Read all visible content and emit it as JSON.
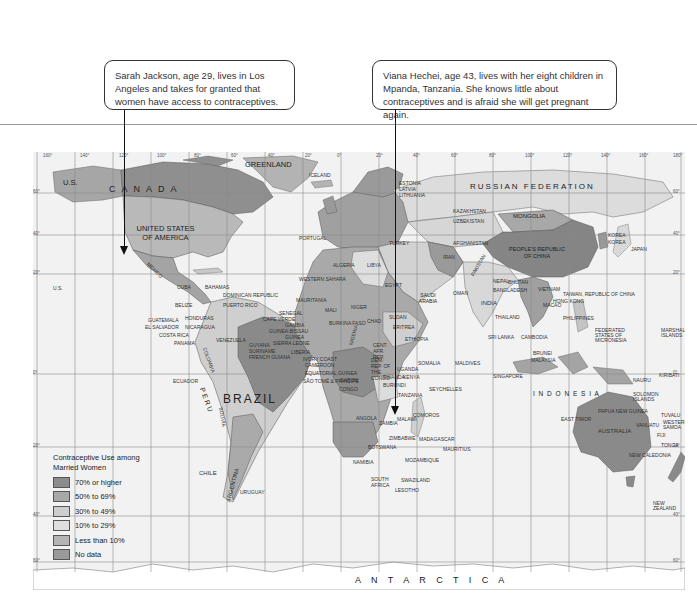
{
  "callouts": [
    {
      "id": "sarah",
      "text": "Sarah Jackson, age 29, lives in Los Angeles and takes for granted that women have access to contraceptives.",
      "points_to": "Los Angeles, United States"
    },
    {
      "id": "viana",
      "text": "Viana Hechei, age 43, lives with her eight children in Mpanda, Tanzania. She knows little about contraceptives and is afraid she will get pregnant again.",
      "points_to": "Mpanda, Tanzania"
    }
  ],
  "legend": {
    "title": "Contraceptive Use among Married Women",
    "items": [
      {
        "label": "70% or higher",
        "color": "#8c8c8c"
      },
      {
        "label": "50% to 69%",
        "color": "#a8a8a8"
      },
      {
        "label": "30% to 49%",
        "color": "#cdcdcd"
      },
      {
        "label": "10% to 29%",
        "color": "#dedede"
      },
      {
        "label": "Less than 10%",
        "color": "#b4b4b4"
      },
      {
        "label": "No data",
        "color": "#9a9a9a"
      }
    ]
  },
  "map": {
    "ocean_color": "#f2f2f2",
    "grid_color": "#8a8a8a",
    "longitude_ticks": [
      "160°",
      "140°",
      "120°",
      "100°",
      "80°",
      "60°",
      "40°",
      "20°",
      "0°",
      "20°",
      "40°",
      "60°",
      "80°",
      "100°",
      "120°",
      "140°",
      "160°",
      "180°"
    ],
    "latitude_ticks_left": [
      "60°",
      "40°",
      "20°",
      "0°",
      "20°",
      "40°",
      "60°"
    ],
    "latitude_ticks_right": [
      "60°",
      "40°",
      "20°",
      "0°",
      "20°",
      "40°",
      "60°"
    ],
    "labels": {
      "us_alaska": "U.S.",
      "canada": "C A N A D A",
      "greenland": "GREENLAND",
      "iceland": "ICELAND",
      "usa": "UNITED STATES OF AMERICA",
      "us_hawaii": "U.S.",
      "mexico": "MEXICO",
      "cuba": "CUBA",
      "bahamas": "BAHAMAS",
      "dominican_republic": "DOMINICAN REPUBLIC",
      "puerto_rico": "PUERTO RICO",
      "belize": "BELIZE",
      "honduras": "HONDURAS",
      "guatemala": "GUATEMALA",
      "el_salvador": "EL SALVADOR",
      "nicaragua": "NICARAGUA",
      "costa_rica": "COSTA RICA",
      "panama": "PANAMA",
      "venezuela": "VENEZUELA",
      "guyana": "GUYANA",
      "suriname": "SURINAME",
      "french_guiana": "FRENCH GUIANA",
      "colombia": "COLOMBIA",
      "ecuador": "ECUADOR",
      "peru": "PERU",
      "brazil": "BRAZIL",
      "bolivia": "BOLIVIA",
      "chile": "CHILE",
      "argentina": "ARGENTINA",
      "uruguay": "URUGUAY",
      "portugal": "PORTUGAL",
      "russia": "RUSSIAN FEDERATION",
      "estonia": "ESTONIA",
      "latvia": "LATVIA",
      "lithuania": "LITHUANIA",
      "kazakhstan": "KAZAKHSTAN",
      "uzbekistan": "UZBEKISTAN",
      "mongolia": "MONGOLIA",
      "china": "PEOPLE'S REPUBLIC OF CHINA",
      "korea_n": "KOREA",
      "korea_s": "KOREA",
      "japan": "JAPAN",
      "turkey": "TURKEY",
      "iran": "IRAN",
      "afghanistan": "AFGHANISTAN",
      "pakistan": "PAKISTAN",
      "india": "INDIA",
      "nepal": "NEPAL",
      "bhutan": "BHUTAN",
      "bangladesh": "BANGLADESH",
      "saudi_arabia": "SAUDI ARABIA",
      "oman": "OMAN",
      "egypt": "EGYPT",
      "libya": "LIBYA",
      "algeria": "ALGERIA",
      "morocco": "MOROCCO",
      "western_sahara": "WESTERN SAHARA",
      "mauritania": "MAURITANIA",
      "mali": "MALI",
      "niger": "NIGER",
      "chad": "CHAD",
      "sudan": "SUDAN",
      "senegal": "SENEGAL",
      "cape_verde": "CAPE VERDE",
      "gambia": "GAMBIA",
      "guinea_bissau": "GUINEA-BISSAU",
      "guinea": "GUINEA",
      "sierra_leone": "SIERRA LEONE",
      "liberia": "LIBERIA",
      "ivory_coast": "IVORY COAST",
      "burkina_faso": "BURKINA FASO",
      "nigeria": "NIGERIA",
      "cameroon": "CAMEROON",
      "equatorial_guinea": "EQUATORIAL GUINEA",
      "sao_tome": "SÃO TOMÉ & PRINCIPE",
      "gabon": "GABON",
      "congo": "CONGO",
      "car": "CENT. AFR. REP.",
      "drc": "DEM. REP. OF THE CONGO",
      "ethiopia": "ETHIOPIA",
      "eritrea": "ERITREA",
      "somalia": "SOMALIA",
      "uganda": "UGANDA",
      "kenya": "KENYA",
      "rwanda": "RWANDA",
      "burundi": "BURUNDI",
      "tanzania": "TANZANIA",
      "angola": "ANGOLA",
      "zambia": "ZAMBIA",
      "malawi": "MALAWI",
      "zimbabwe": "ZIMBABWE",
      "mozambique": "MOZAMBIQUE",
      "namibia": "NAMIBIA",
      "botswana": "BOTSWANA",
      "south_africa": "SOUTH AFRICA",
      "swaziland": "SWAZILAND",
      "lesotho": "LESOTHO",
      "madagascar": "MADAGASCAR",
      "mauritius": "MAURITIUS",
      "seychelles": "SEYCHELLES",
      "comoros": "COMOROS",
      "maldives": "MALDIVES",
      "sri_lanka": "SRI LANKA",
      "thailand": "THAILAND",
      "vietnam": "VIETNAM",
      "cambodia": "CAMBODIA",
      "taiwan": "TAIWAN, REPUBLIC OF CHINA",
      "hong_kong": "HONG KONG",
      "macao": "MACAO",
      "philippines": "PHILIPPINES",
      "brunei": "BRUNEI",
      "malaysia": "MALAYSIA",
      "singapore": "SINGAPORE",
      "indonesia": "I N D O N E S I A",
      "east_timor": "EAST TIMOR",
      "papua_new_guinea": "PAPUA NEW GUINEA",
      "micronesia": "FEDERATED STATES OF MICRONESIA",
      "marshall_islands": "MARSHALL ISLANDS",
      "nauru": "NAURU",
      "kiribati": "KIRIBATI",
      "solomon_islands": "SOLOMON ISLANDS",
      "tuvalu": "TUVALU",
      "vanuatu": "VANUATU",
      "western_samoa": "WESTERN SAMOA",
      "fiji": "FIJI",
      "tonga": "TONGA",
      "new_caledonia": "NEW CALEDONIA",
      "australia": "AUSTRALIA",
      "new_zealand": "NEW ZEALAND",
      "antarctica": "A N T A R C T I C A"
    }
  }
}
